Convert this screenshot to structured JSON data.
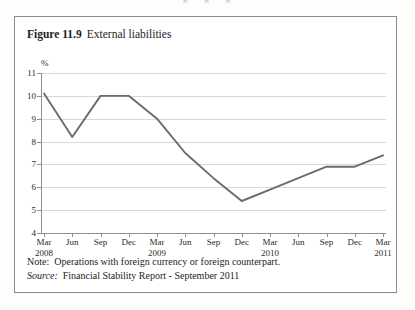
{
  "page": {
    "bleed_text_top": "g g g"
  },
  "figure": {
    "number": "Figure 11.9",
    "name": "External liabilities",
    "note_label": "Note:",
    "note_text": "Operations with foreign currency or foreign counterpart.",
    "source_label": "Source:",
    "source_text": "Financial Stability Report - September 2011"
  },
  "chart_data": {
    "type": "line",
    "title": "External liabilities",
    "xlabel": "",
    "ylabel": "%",
    "ylim": [
      4,
      11
    ],
    "yticks": [
      4,
      5,
      6,
      7,
      8,
      9,
      10,
      11
    ],
    "grid": true,
    "legend": false,
    "line_color": "#6b6b6b",
    "categories": [
      "Mar 2008",
      "Jun",
      "Sep",
      "Dec",
      "Mar 2009",
      "Jun",
      "Sep",
      "Dec",
      "Mar 2010",
      "Jun",
      "Sep",
      "Dec",
      "Mar 2011"
    ],
    "tick_labels": [
      {
        "month": "Mar",
        "year": "2008"
      },
      {
        "month": "Jun",
        "year": ""
      },
      {
        "month": "Sep",
        "year": ""
      },
      {
        "month": "Dec",
        "year": ""
      },
      {
        "month": "Mar",
        "year": "2009"
      },
      {
        "month": "Jun",
        "year": ""
      },
      {
        "month": "Sep",
        "year": ""
      },
      {
        "month": "Dec",
        "year": ""
      },
      {
        "month": "Mar",
        "year": "2010"
      },
      {
        "month": "Jun",
        "year": ""
      },
      {
        "month": "Sep",
        "year": ""
      },
      {
        "month": "Dec",
        "year": ""
      },
      {
        "month": "Mar",
        "year": "2011"
      }
    ],
    "values": [
      10.1,
      8.2,
      10.0,
      10.0,
      9.0,
      7.5,
      6.4,
      5.4,
      5.9,
      6.4,
      6.9,
      6.9,
      7.4
    ]
  }
}
